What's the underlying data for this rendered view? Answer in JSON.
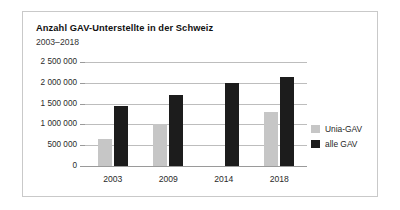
{
  "card": {
    "title": "Anzahl GAV-Unterstellte in der Schweiz",
    "subtitle": "2003–2018"
  },
  "legend": {
    "items": [
      {
        "label": "Unia-GAV",
        "color": "#c6c6c6",
        "swatch_name": "legend-swatch-unia"
      },
      {
        "label": "alle GAV",
        "color": "#1c1c1c",
        "swatch_name": "legend-swatch-alle"
      }
    ]
  },
  "axis": {
    "y_tick_labels": [
      "2 500 000",
      "2 000 000",
      "1 500 000",
      "1 000 000",
      "500 000",
      "0"
    ],
    "x_tick_labels": [
      "2003",
      "2009",
      "2014",
      "2018"
    ]
  },
  "chart_data": {
    "type": "bar",
    "title": "Anzahl GAV-Unterstellte in der Schweiz",
    "subtitle": "2003–2018",
    "xlabel": "",
    "ylabel": "",
    "ylim": [
      0,
      2500000
    ],
    "ytick_values": [
      0,
      500000,
      1000000,
      1500000,
      2000000,
      2500000
    ],
    "ytick_labels": [
      "0",
      "500 000",
      "1 000 000",
      "1 500 000",
      "2 000 000",
      "2 500 000"
    ],
    "grid": true,
    "legend_position": "right",
    "categories": [
      "2003",
      "2009",
      "2014",
      "2018"
    ],
    "series": [
      {
        "name": "Unia-GAV",
        "color": "#c6c6c6",
        "values": [
          650000,
          1000000,
          null,
          1300000
        ]
      },
      {
        "name": "alle GAV",
        "color": "#1c1c1c",
        "values": [
          1450000,
          1700000,
          2000000,
          2150000
        ]
      }
    ]
  }
}
